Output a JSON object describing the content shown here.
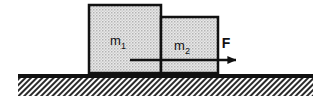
{
  "figure": {
    "background_color": "#ffffff",
    "width": 326,
    "height": 107
  },
  "blocks": [
    {
      "id": "block-1",
      "label": "m",
      "subscript": "1",
      "label_full": "m₁",
      "x": 89,
      "y": 5,
      "width": 72,
      "height": 68,
      "fill_color": "#d8d8d8",
      "border_color": "#111111",
      "border_width": 2.5,
      "label_x": 123,
      "label_y": 45
    },
    {
      "id": "block-2",
      "label": "m",
      "subscript": "2",
      "label_full": "m₂",
      "x": 161,
      "y": 17,
      "width": 57,
      "height": 56,
      "fill_color": "#d8d8d8",
      "border_color": "#111111",
      "border_width": 2.5,
      "label_x": 182,
      "label_y": 50
    }
  ],
  "force_arrow": {
    "label": "F",
    "label_x": 226,
    "label_y": 48,
    "start_x": 130,
    "end_x": 243,
    "y": 60,
    "shaft_width": 2.5,
    "head_length": 13,
    "head_half_width": 6,
    "color": "#111111",
    "direction": "right"
  },
  "ground": {
    "line_x_start": 18,
    "line_x_end": 313,
    "line_y": 76,
    "line_thickness": 4,
    "hatch_top": 78,
    "hatch_bottom": 96,
    "hatch_color": "#222222",
    "hatch_spacing": 4,
    "hatch_angle_deg": 45,
    "description": "hatched ground surface"
  }
}
